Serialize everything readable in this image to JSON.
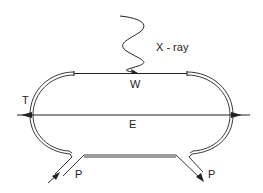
{
  "diagram": {
    "type": "storage-ring schematic",
    "labels": {
      "xray": "X - ray",
      "wiggler": "W",
      "tube": "T",
      "electron_beam": "E",
      "port_left": "P",
      "port_right": "P"
    },
    "colors": {
      "line": "#222222",
      "background": "#ffffff"
    }
  }
}
